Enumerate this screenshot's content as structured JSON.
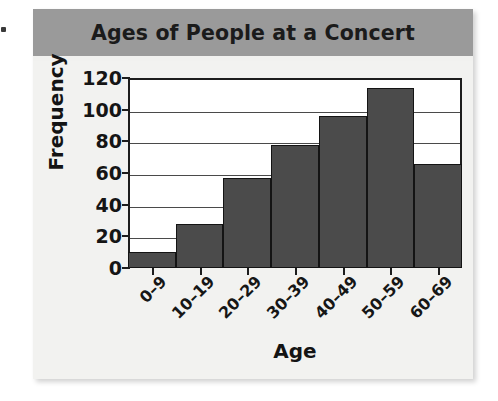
{
  "figure": {
    "title": "Ages of People at a Concert",
    "title_band_color": "#9a9a9a",
    "card_background": "#f1f1ef",
    "plot_background": "#ffffff",
    "bar_color": "#4b4b4b",
    "axis_color": "#1d1d1d"
  },
  "chart_data": {
    "type": "bar",
    "title": "Ages of People at a Concert",
    "xlabel": "Age",
    "ylabel": "Frequency",
    "categories": [
      "0–9",
      "10–19",
      "20–29",
      "30–39",
      "40–49",
      "50–59",
      "60–69"
    ],
    "values": [
      10,
      28,
      57,
      78,
      96,
      114,
      66
    ],
    "ylim": [
      0,
      120
    ],
    "ytick_values": [
      0,
      20,
      40,
      60,
      80,
      100,
      120
    ],
    "ytick_labels": [
      "0",
      "20",
      "40",
      "60",
      "80",
      "100",
      "120"
    ],
    "grid": "horizontal",
    "legend": "none",
    "xtick_rotation": -45,
    "bar_gap": 0
  }
}
